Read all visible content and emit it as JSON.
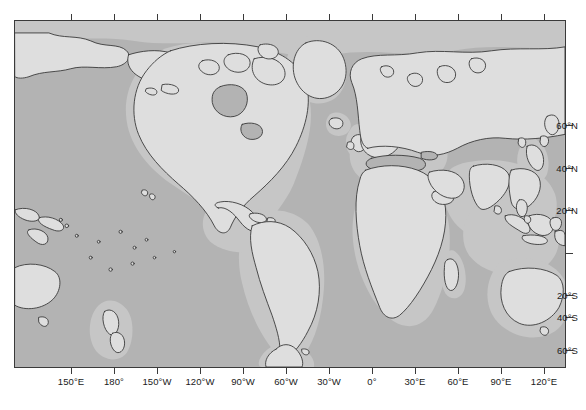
{
  "map": {
    "title": "World Map (Pacific-centred equirectangular)",
    "projection": "equirectangular",
    "frame": {
      "left": 14,
      "top": 20,
      "width": 552,
      "height": 348
    },
    "extent": {
      "lon_min": 130,
      "lon_max": 130,
      "lat_min": -78,
      "lat_max": 84
    },
    "colors": {
      "ocean": "#b3b3b3",
      "shelf": "#c6c6c6",
      "land": "#dedede",
      "coastline": "#3a3a3a",
      "frame": "#3a3a3a",
      "page_background": "#ffffff",
      "label": "#1a1a1a"
    },
    "longitude_axis": {
      "position": "bottom",
      "labels": [
        {
          "text": "150°E",
          "value": 150,
          "x": 57
        },
        {
          "text": "180°",
          "value": 180,
          "x": 100
        },
        {
          "text": "150°W",
          "value": -150,
          "x": 143
        },
        {
          "text": "120°W",
          "value": -120,
          "x": 186
        },
        {
          "text": "90°W",
          "value": -90,
          "x": 229
        },
        {
          "text": "60°W",
          "value": -60,
          "x": 272
        },
        {
          "text": "30°W",
          "value": -30,
          "x": 315
        },
        {
          "text": "0°",
          "value": 0,
          "x": 358
        },
        {
          "text": "30°E",
          "value": 30,
          "x": 401
        },
        {
          "text": "60°E",
          "value": 60,
          "x": 444
        },
        {
          "text": "90°E",
          "value": 90,
          "x": 487
        },
        {
          "text": "120°E",
          "value": 120,
          "x": 530
        }
      ]
    },
    "latitude_axis": {
      "position": "right",
      "labels": [
        {
          "text": "60°N",
          "value": 60,
          "y": 105
        },
        {
          "text": "40°N",
          "value": 40,
          "y": 148
        },
        {
          "text": "20°N",
          "value": 20,
          "y": 190
        },
        {
          "text": "",
          "value": 0,
          "y": 233
        },
        {
          "text": "20°S",
          "value": -20,
          "y": 275
        },
        {
          "text": "40°S",
          "value": -40,
          "y": 297
        },
        {
          "text": "60°S",
          "value": -60,
          "y": 330
        }
      ]
    },
    "features": {
      "continents": [
        "North America",
        "South America",
        "Africa",
        "Europe",
        "Asia",
        "Australia",
        "Antarctica (peninsula)"
      ],
      "notable_islands": [
        "Greenland",
        "Iceland",
        "Japan",
        "New Zealand",
        "Madagascar",
        "Philippines",
        "Indonesia",
        "British Isles",
        "Hawaii",
        "Caribbean"
      ]
    }
  }
}
